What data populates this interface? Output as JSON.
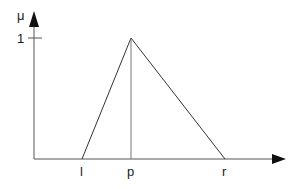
{
  "diagram": {
    "type": "triangular-membership-function",
    "y_axis_label": "μ",
    "y_tick_label": "1",
    "x_tick_labels": {
      "left": "l",
      "peak": "p",
      "right": "r"
    },
    "colors": {
      "line": "#333333",
      "axis": "#555555",
      "background": "#ffffff"
    }
  }
}
